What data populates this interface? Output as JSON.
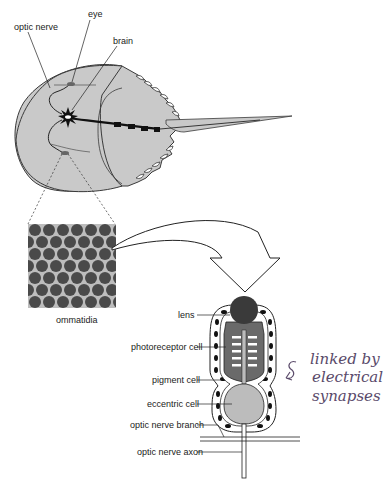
{
  "figure": {
    "top_labels": {
      "optic_nerve": "optic nerve",
      "eye": "eye",
      "brain": "brain"
    },
    "inset_label": "ommatidia",
    "ommatidium_labels": {
      "lens": "lens",
      "photoreceptor": "photoreceptor cell",
      "pigment": "pigment cell",
      "eccentric": "eccentric cell",
      "branch": "optic nerve branch",
      "axon": "optic nerve axon"
    },
    "annotation": {
      "line1": "linked by",
      "line2": "electrical",
      "line3": "synapses"
    },
    "colors": {
      "body_fill": "#c9c9c9",
      "outline": "#3a3a3a",
      "nerve": "#111111",
      "ommatidia_bg": "#bdbdbd",
      "ommatidia_cell": "#4a4a4a",
      "lens": "#3a3a3a",
      "photoreceptor": "#6a6a6a",
      "eccentric": "#bcbcbc",
      "annotation_ink": "#5a4a6a"
    }
  }
}
